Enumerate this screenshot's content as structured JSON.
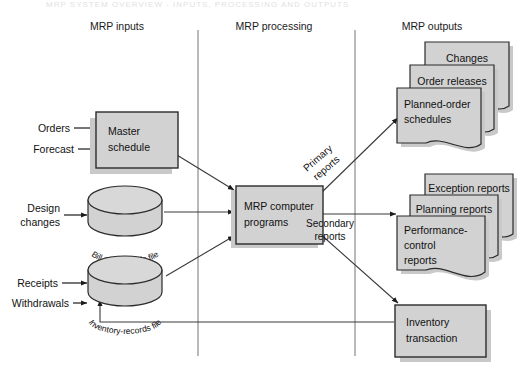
{
  "diagram": {
    "title_strip": "MRP SYSTEM OVERVIEW  -  INPUTS, PROCESSING AND OUTPUTS",
    "columns": [
      {
        "id": "inputs",
        "label": "MRP inputs"
      },
      {
        "id": "processing",
        "label": "MRP processing"
      },
      {
        "id": "outputs",
        "label": "MRP outputs"
      }
    ],
    "inputs": {
      "orders_label": "Orders",
      "forecast_label": "Forecast",
      "design_changes_label_line1": "Design",
      "design_changes_label_line2": "changes",
      "receipts_label": "Receipts",
      "withdrawals_label": "Withdrawals"
    },
    "nodes": {
      "master_schedule": {
        "line1": "Master",
        "line2": "schedule"
      },
      "bill_of_materials": {
        "label": "Bill of materials file"
      },
      "inventory_records": {
        "label": "Inventory-records file"
      },
      "mrp_programs": {
        "line1": "MRP computer",
        "line2": "programs"
      },
      "inventory_transaction": {
        "line1": "Inventory",
        "line2": "transaction"
      }
    },
    "flows": {
      "primary_line1": "Primary",
      "primary_line2": "reports",
      "secondary_line1": "Secondary",
      "secondary_line2": "reports"
    },
    "outputs": {
      "primary_stack": [
        {
          "label": "Changes"
        },
        {
          "label": "Order releases"
        },
        {
          "line1": "Planned-order",
          "line2": "schedules"
        }
      ],
      "secondary_stack": [
        {
          "label": "Exception reports"
        },
        {
          "label": "Planning reports"
        },
        {
          "line1": "Performance-",
          "line2": "control",
          "line3": "reports"
        }
      ]
    },
    "colors": {
      "node_fill": "#d2d2d2",
      "node_stroke": "#2b2b2b",
      "shadow": "#c9c9c9",
      "divider": "#8a8a8a",
      "arrow": "#1c1c1c",
      "background": "#ffffff"
    }
  }
}
